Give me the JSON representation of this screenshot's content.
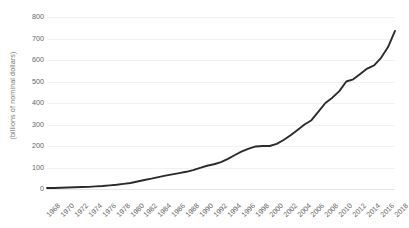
{
  "chart_data": {
    "type": "line",
    "title": "",
    "subtitle": "",
    "xlabel": "",
    "ylabel": "(billions of nominal dollars)",
    "ylim": [
      0,
      800
    ],
    "ytick_values": [
      800,
      700,
      600,
      500,
      400,
      300,
      200,
      100,
      0
    ],
    "ytick_labels": [
      "800",
      "700",
      "600",
      "500",
      "400",
      "300",
      "200",
      "100",
      "0"
    ],
    "grid": true,
    "legend": false,
    "legend_position": "none",
    "line_color": "#2b2b28",
    "gridline_color": "#f2f2ef",
    "background_color": "#ffffff",
    "x": [
      1968,
      1969,
      1970,
      1971,
      1972,
      1973,
      1974,
      1975,
      1976,
      1977,
      1978,
      1979,
      1980,
      1981,
      1982,
      1983,
      1984,
      1985,
      1986,
      1987,
      1988,
      1989,
      1990,
      1991,
      1992,
      1993,
      1994,
      1995,
      1996,
      1997,
      1998,
      1999,
      2000,
      2001,
      2002,
      2003,
      2004,
      2005,
      2006,
      2007,
      2008,
      2009,
      2010,
      2011,
      2012,
      2013,
      2014,
      2015,
      2016,
      2017,
      2018
    ],
    "values": [
      5,
      5,
      6,
      7,
      8,
      9,
      10,
      12,
      14,
      17,
      20,
      24,
      28,
      35,
      42,
      48,
      55,
      62,
      68,
      74,
      80,
      88,
      98,
      108,
      115,
      125,
      140,
      158,
      175,
      188,
      198,
      200,
      200,
      210,
      228,
      250,
      275,
      300,
      320,
      360,
      400,
      425,
      455,
      500,
      510,
      535,
      560,
      575,
      610,
      660,
      735
    ],
    "xtick_labels": [
      "1968",
      "1970",
      "1972",
      "1974",
      "1976",
      "1978",
      "1980",
      "1982",
      "1984",
      "1986",
      "1988",
      "1990",
      "1992",
      "1994",
      "1996",
      "1998",
      "2000",
      "2002",
      "2004",
      "2006",
      "2008",
      "2010",
      "2012",
      "2014",
      "2016",
      "2018"
    ],
    "xtick_values": [
      1968,
      1970,
      1972,
      1974,
      1976,
      1978,
      1980,
      1982,
      1984,
      1986,
      1988,
      1990,
      1992,
      1994,
      1996,
      1998,
      2000,
      2002,
      2004,
      2006,
      2008,
      2010,
      2012,
      2014,
      2016,
      2018
    ],
    "xlim": [
      1968,
      2018
    ]
  }
}
